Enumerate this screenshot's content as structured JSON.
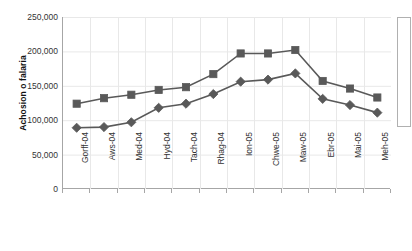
{
  "chart_data": {
    "type": "line",
    "title": "",
    "xlabel": "",
    "ylabel": "Achosion o falaria",
    "ylim": [
      0,
      250000
    ],
    "yticks": [
      0,
      50000,
      100000,
      150000,
      200000,
      250000
    ],
    "ytick_labels": [
      "0",
      "50,000",
      "100,000",
      "150,000",
      "200,000",
      "250,000"
    ],
    "grid": true,
    "legend_position": "right",
    "categories": [
      "Gorff-04",
      "Aws-04",
      "Med-04",
      "Hyd-04",
      "Tach-04",
      "Rhag-04",
      "Ion-05",
      "Chwe-05",
      "Maw-05",
      "Ebr-05",
      "Mai-05",
      "Meh-05"
    ],
    "series": [
      {
        "name": "Cyfres 1",
        "marker": "square",
        "color": "#595959",
        "values": [
          124000,
          132000,
          137000,
          144000,
          148000,
          167000,
          197000,
          197000,
          202000,
          157000,
          146000,
          133000
        ]
      },
      {
        "name": "Cyfres 2",
        "marker": "diamond",
        "color": "#595959",
        "values": [
          89000,
          90000,
          97000,
          118000,
          124000,
          138000,
          156000,
          159000,
          168000,
          131000,
          122000,
          111000
        ]
      }
    ]
  },
  "colors": {
    "series": "#595959",
    "grid": "#e8e8e8",
    "axis": "#a6a6a6",
    "text": "#333333",
    "background": "#ffffff"
  }
}
